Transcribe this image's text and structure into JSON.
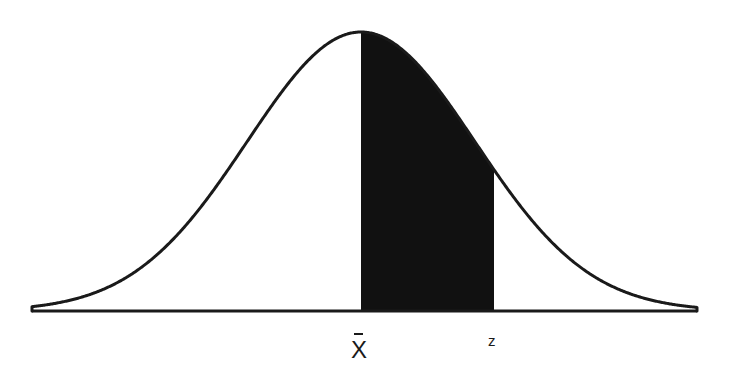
{
  "diagram": {
    "type": "normal-distribution",
    "labels": {
      "mean": "X",
      "mean_has_bar": true,
      "z": "z"
    },
    "colors": {
      "background": "#ffffff",
      "curve": "#1a1a1a",
      "shaded_area": "#111111",
      "baseline": "#1a1a1a"
    },
    "geometry": {
      "baseline_y": 311,
      "peak_y": 32,
      "mean_x": 361,
      "sigma_px": 114,
      "left_end_x": 32,
      "right_end_x": 697,
      "shade_from_x": 361,
      "shade_to_x": 494
    },
    "shaded_region": {
      "from": "mean",
      "to": "z"
    }
  }
}
